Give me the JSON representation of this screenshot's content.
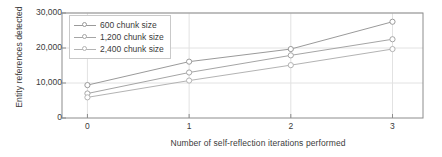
{
  "chart_data": {
    "type": "line",
    "title": "",
    "xlabel": "Number of self-reflection iterations performed",
    "ylabel": "Entity references detected",
    "x": [
      0,
      1,
      2,
      3
    ],
    "xtick_labels": [
      "0",
      "1",
      "2",
      "3"
    ],
    "ytick_values": [
      0,
      10000,
      20000,
      30000
    ],
    "ytick_labels": [
      "0",
      "10,000",
      "20,000",
      "30,000"
    ],
    "xlim": [
      -0.25,
      3.3
    ],
    "ylim": [
      0,
      30000
    ],
    "grid": true,
    "legend_position": "upper-left-inside",
    "marker": "circle-open",
    "series": [
      {
        "name": "600 chunk size",
        "values": [
          9400,
          16100,
          19700,
          27500
        ],
        "color": "#9a9a9a"
      },
      {
        "name": "1,200 chunk size",
        "values": [
          7000,
          13000,
          17900,
          22500
        ],
        "color": "#a5a5a5"
      },
      {
        "name": "2,400 chunk size",
        "values": [
          5900,
          10700,
          15100,
          19700
        ],
        "color": "#b3b3b3"
      }
    ],
    "axis_color": "#8c8c8c",
    "grid_color": "#e2e2e2",
    "text_color": "#3b3b3b",
    "background": "#ffffff"
  }
}
